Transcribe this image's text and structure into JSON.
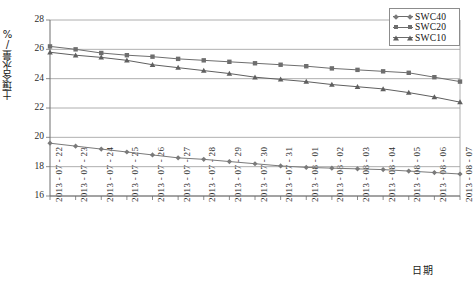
{
  "chart_data": {
    "type": "line",
    "title": "",
    "xlabel": "日期",
    "ylabel": "土壤含水量/%",
    "ylim": [
      16,
      28
    ],
    "ytick_values": [
      28,
      26,
      24,
      22,
      20,
      18,
      16
    ],
    "grid": true,
    "legend_position": "top-right",
    "categories": [
      "2013 - 07 - 22",
      "2013 - 07 - 23",
      "2013 - 07 - 24",
      "2013 - 07 - 25",
      "2013 - 07 - 26",
      "2013 - 07 - 27",
      "2013 - 07 - 28",
      "2013 - 07 - 29",
      "2013 - 07 - 30",
      "2013 - 07 - 31",
      "2013 - 08 - 01",
      "2013 - 08 - 02",
      "2013 - 08 - 03",
      "2013 - 08 - 04",
      "2013 - 08 - 05",
      "2013 - 08 - 06",
      "2013 - 08 - 07"
    ],
    "series": [
      {
        "name": "SWC40",
        "marker": "diamond",
        "color": "#7a7a7a",
        "values": [
          19.6,
          19.4,
          19.2,
          19.0,
          18.8,
          18.6,
          18.5,
          18.35,
          18.2,
          18.05,
          17.95,
          17.9,
          17.85,
          17.8,
          17.7,
          17.6,
          17.5
        ]
      },
      {
        "name": "SWC20",
        "marker": "square",
        "color": "#6e6e6e",
        "values": [
          26.2,
          26.0,
          25.75,
          25.6,
          25.5,
          25.35,
          25.25,
          25.15,
          25.05,
          24.95,
          24.85,
          24.7,
          24.6,
          24.5,
          24.4,
          24.1,
          23.8
        ]
      },
      {
        "name": "SWC10",
        "marker": "triangle",
        "color": "#5f5f5f",
        "values": [
          25.8,
          25.6,
          25.45,
          25.25,
          24.95,
          24.75,
          24.55,
          24.35,
          24.1,
          23.95,
          23.8,
          23.6,
          23.45,
          23.3,
          23.05,
          22.75,
          22.4
        ]
      }
    ]
  },
  "legend": {
    "items": [
      {
        "label": "SWC40"
      },
      {
        "label": "SWC20"
      },
      {
        "label": "SWC10"
      }
    ]
  }
}
